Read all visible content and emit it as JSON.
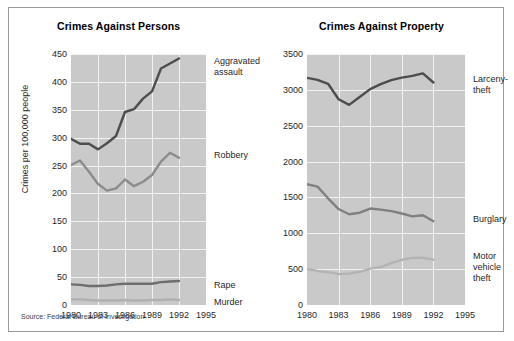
{
  "figure": {
    "source_note": "Source: Federal Bureau of Investigation",
    "plot_bg": "#c9c9c9",
    "grid_color": "#f2f2f2",
    "frame_color": "#9a9a9a"
  },
  "chart_data": [
    {
      "type": "line",
      "title": "Crimes Against Persons",
      "xlabel": "",
      "ylabel": "Crimes per 100,000 people",
      "x": [
        1980,
        1981,
        1982,
        1983,
        1984,
        1985,
        1986,
        1987,
        1988,
        1989,
        1990,
        1991,
        1992
      ],
      "xlim": [
        1980,
        1995
      ],
      "ylim": [
        0,
        450
      ],
      "xticks": [
        1980,
        1983,
        1986,
        1989,
        1992,
        1995
      ],
      "yticks": [
        0,
        50,
        100,
        150,
        200,
        250,
        300,
        350,
        400,
        450
      ],
      "grid": true,
      "legend_position": "right-of-plot",
      "series": [
        {
          "name": "Aggravated assault",
          "color": "#4d4d4d",
          "values": [
            298,
            289,
            289,
            279,
            290,
            303,
            346,
            351,
            370,
            383,
            424,
            433,
            442
          ]
        },
        {
          "name": "Robbery",
          "color": "#8c8c8c",
          "values": [
            251,
            259,
            239,
            217,
            205,
            209,
            225,
            213,
            221,
            233,
            257,
            273,
            264
          ]
        },
        {
          "name": "Rape",
          "color": "#6e6e6e",
          "values": [
            37,
            36,
            34,
            34,
            35,
            37,
            38,
            38,
            38,
            38,
            41,
            42,
            43
          ]
        },
        {
          "name": "Murder",
          "color": "#b0b0b0",
          "values": [
            10,
            10,
            9,
            8,
            8,
            8,
            9,
            8,
            8,
            9,
            9,
            10,
            9
          ]
        }
      ]
    },
    {
      "type": "line",
      "title": "Crimes Against Property",
      "xlabel": "",
      "ylabel": "",
      "x": [
        1980,
        1981,
        1982,
        1983,
        1984,
        1985,
        1986,
        1987,
        1988,
        1989,
        1990,
        1991,
        1992
      ],
      "xlim": [
        1980,
        1995
      ],
      "ylim": [
        0,
        3500
      ],
      "xticks": [
        1980,
        1983,
        1986,
        1989,
        1992,
        1995
      ],
      "yticks": [
        0,
        500,
        1000,
        1500,
        2000,
        2500,
        3000,
        3500
      ],
      "grid": true,
      "legend_position": "right-of-plot",
      "series": [
        {
          "name": "Larceny-theft",
          "color": "#4d4d4d",
          "values": [
            3167,
            3140,
            3085,
            2869,
            2791,
            2901,
            3010,
            3081,
            3135,
            3171,
            3195,
            3229,
            3103
          ]
        },
        {
          "name": "Burglary",
          "color": "#808080",
          "values": [
            1684,
            1650,
            1488,
            1338,
            1265,
            1287,
            1345,
            1330,
            1309,
            1276,
            1236,
            1252,
            1168
          ]
        },
        {
          "name": "Motor vehicle theft",
          "color": "#b3b3b3",
          "values": [
            502,
            475,
            459,
            431,
            437,
            463,
            508,
            529,
            583,
            630,
            657,
            659,
            632
          ]
        }
      ]
    }
  ],
  "panels": {
    "left": {
      "title": "Crimes Against Persons",
      "ylabel": "Crimes per 100,000 people",
      "yticks": [
        "450",
        "400",
        "350",
        "300",
        "250",
        "200",
        "150",
        "100",
        "50",
        "0"
      ],
      "xticks": [
        "1980",
        "1983",
        "1986",
        "1989",
        "1992",
        "1995"
      ],
      "labels": [
        {
          "text": "Aggravated\nassault",
          "name": "series-label-aggravated-assault"
        },
        {
          "text": "Robbery",
          "name": "series-label-robbery"
        },
        {
          "text": "Rape",
          "name": "series-label-rape"
        },
        {
          "text": "Murder",
          "name": "series-label-murder"
        }
      ]
    },
    "right": {
      "title": "Crimes Against Property",
      "yticks": [
        "3500",
        "3000",
        "2500",
        "2000",
        "1500",
        "1000",
        "500",
        "0"
      ],
      "xticks": [
        "1980",
        "1983",
        "1986",
        "1989",
        "1992",
        "1995"
      ],
      "labels": [
        {
          "text": "Larceny-\ntheft",
          "name": "series-label-larceny-theft"
        },
        {
          "text": "Burglary",
          "name": "series-label-burglary"
        },
        {
          "text": "Motor\nvehicle\ntheft",
          "name": "series-label-motor-vehicle-theft"
        }
      ]
    }
  }
}
